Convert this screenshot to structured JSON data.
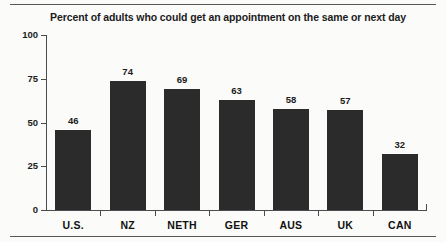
{
  "chart_data": {
    "type": "bar",
    "title": "Percent of adults who could get an appointment on the same or next day",
    "xlabel": "",
    "ylabel": "",
    "categories": [
      "U.S.",
      "NZ",
      "NETH",
      "GER",
      "AUS",
      "UK",
      "CAN"
    ],
    "values": [
      46,
      74,
      69,
      63,
      58,
      57,
      32
    ],
    "value_labels": [
      "46",
      "74",
      "69",
      "63",
      "58",
      "57",
      "32"
    ],
    "ylim": [
      0,
      100
    ],
    "yticks": [
      0,
      25,
      50,
      75,
      100
    ],
    "ytick_labels": [
      "0",
      "25",
      "50",
      "75",
      "100"
    ],
    "grid": false,
    "legend": null,
    "bar_color": "#2b2b2b",
    "axis_color": "#4a4d4f",
    "background_color": "#fbfbfa",
    "text_color": "#1c1c1c"
  }
}
